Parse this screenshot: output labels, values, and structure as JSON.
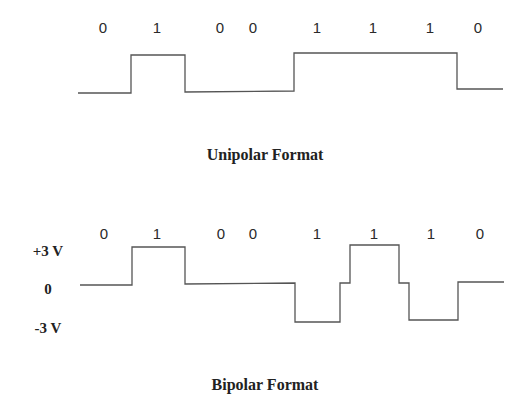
{
  "diagrams": {
    "unipolar": {
      "caption": "Unipolar Format",
      "bits": [
        "0",
        "1",
        "0",
        "0",
        "1",
        "1",
        "1",
        "0"
      ],
      "bit_x": [
        103,
        157,
        220,
        253,
        317,
        373,
        430,
        478
      ],
      "bit_y": 33,
      "waveform_points": "78,93 131,93 131,55 185,55 185,92 294,91 294,53 457,53 457,89 503,89",
      "caption_x": 265,
      "caption_y": 160
    },
    "bipolar": {
      "caption": "Bipolar Format",
      "bits": [
        "0",
        "1",
        "0",
        "0",
        "1",
        "1",
        "1",
        "0"
      ],
      "bit_x": [
        104,
        157,
        221,
        253,
        317,
        374,
        431,
        480
      ],
      "bit_y": 239,
      "y_axis_labels": [
        {
          "text": "+3 V",
          "y": 256
        },
        {
          "text": "0",
          "y": 294
        },
        {
          "text": "-3 V",
          "y": 333
        }
      ],
      "y_label_x": 48,
      "waveform_points": "80,285 132,285 132,247 185,247 185,284 295,283 295,322 340,322 340,283 350,283 350,245 399,245 399,283 409,283 409,320 458,320 458,282 504,282",
      "caption_x": 265,
      "caption_y": 390
    }
  }
}
